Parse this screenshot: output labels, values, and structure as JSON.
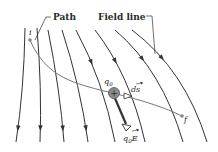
{
  "figure": {
    "labels": {
      "path": "Path",
      "field_line": "Field line",
      "initial_point": "i",
      "final_point": "f",
      "charge": "q",
      "charge_sub": "0",
      "displacement": "ds",
      "force_q": "q",
      "force_sub": "0",
      "force_E": "E"
    },
    "charge_sign": "+",
    "colors": {
      "line": "#333333",
      "path": "#666666",
      "charge_fill": "#8a8a8a",
      "charge_stroke": "#555555",
      "force_arrow": "#333333"
    },
    "field_line_count": 8
  }
}
